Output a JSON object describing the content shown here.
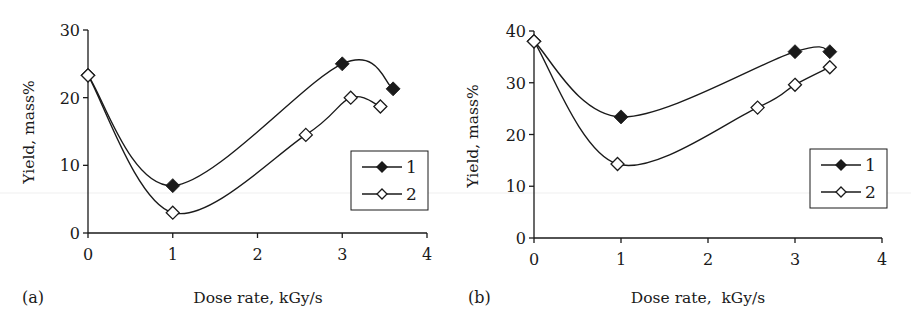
{
  "chart_data": [
    {
      "type": "line",
      "panel_label": "(a)",
      "title": "",
      "xlabel": "Dose rate, kGy/s",
      "ylabel": "Yield, mass%",
      "xlim": [
        0,
        4
      ],
      "ylim": [
        0,
        30
      ],
      "xticks": [
        "0",
        "1",
        "2",
        "3",
        "4"
      ],
      "yticks": [
        "0",
        "10",
        "20",
        "30"
      ],
      "grid": false,
      "legend_position": "right-middle, inside",
      "smooth": true,
      "series": [
        {
          "name": "1",
          "marker": "filled-diamond",
          "points": [
            [
              0,
              23.3
            ],
            [
              1,
              7.0
            ],
            [
              3,
              25.0
            ],
            [
              3.6,
              21.3
            ]
          ]
        },
        {
          "name": "2",
          "marker": "open-diamond",
          "points": [
            [
              0,
              23.3
            ],
            [
              1,
              3.0
            ],
            [
              2.57,
              14.5
            ],
            [
              3.1,
              20.0
            ],
            [
              3.45,
              18.7
            ]
          ]
        }
      ]
    },
    {
      "type": "line",
      "panel_label": "(b)",
      "title": "",
      "xlabel": "Dose rate,  kGy/s",
      "ylabel": "Yield, mass%",
      "xlim": [
        0,
        4
      ],
      "ylim": [
        0,
        40
      ],
      "xticks": [
        "0",
        "1",
        "2",
        "3",
        "4"
      ],
      "yticks": [
        "0",
        "10",
        "20",
        "30",
        "40"
      ],
      "grid": false,
      "legend_position": "right-middle, inside",
      "smooth": true,
      "series": [
        {
          "name": "1",
          "marker": "filled-diamond",
          "points": [
            [
              0,
              38.0
            ],
            [
              1,
              23.4
            ],
            [
              3,
              36.0
            ],
            [
              3.4,
              36.0
            ]
          ]
        },
        {
          "name": "2",
          "marker": "open-diamond",
          "points": [
            [
              0,
              38.0
            ],
            [
              0.96,
              14.3
            ],
            [
              2.57,
              25.2
            ],
            [
              3,
              29.6
            ],
            [
              3.4,
              33.0
            ]
          ]
        }
      ]
    }
  ],
  "panels": {
    "a": {
      "label": "(a)",
      "xlabel": "Dose rate, kGy/s",
      "ylabel": "Yield, mass%",
      "xticks": [
        "0",
        "1",
        "2",
        "3",
        "4"
      ],
      "yticks": [
        "0",
        "10",
        "20",
        "30"
      ],
      "legend": [
        "1",
        "2"
      ]
    },
    "b": {
      "label": "(b)",
      "xlabel": "Dose rate,  kGy/s",
      "ylabel": "Yield, mass%",
      "xticks": [
        "0",
        "1",
        "2",
        "3",
        "4"
      ],
      "yticks": [
        "0",
        "10",
        "20",
        "30",
        "40"
      ],
      "legend": [
        "1",
        "2"
      ]
    }
  },
  "colors": {
    "ink": "#1a1a1a",
    "background": "#ffffff",
    "open_marker_fill": "#ffffff",
    "scan_artifact": "#eeeeee"
  }
}
